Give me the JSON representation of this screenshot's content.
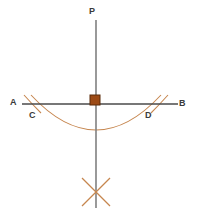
{
  "figure": {
    "kind": "geometry-construction-diagram",
    "background_color": "#ffffff",
    "labels": {
      "perpendicular_top": "P",
      "line_left_end": "A",
      "line_right_end": "B",
      "arc_left_intersection": "C",
      "arc_right_intersection": "D"
    },
    "colors": {
      "line_gray": "#808080",
      "line_dark": "#4a4a4a",
      "arc_tan": "#c6864f",
      "square_fill": "#9c4a15",
      "square_border": "#5a2a08",
      "label_text": "#3a3a3a"
    },
    "geometry": {
      "vertical_line": {
        "x": 96,
        "y_top": 20,
        "y_bottom": 208
      },
      "horizontal_line": {
        "y": 104,
        "x_left": 22,
        "x_right": 178
      },
      "right_angle_marker": {
        "x": 90,
        "y": 95,
        "size": 10
      },
      "main_arc": {
        "start_x": 31,
        "start_y": 95,
        "end_x": 161,
        "end_y": 95,
        "lowest_y": 130
      },
      "cross_mark": {
        "center_x": 96,
        "center_y": 192,
        "radius": 14
      },
      "tick_left": {
        "x": 32,
        "y": 104
      },
      "tick_right": {
        "x": 160,
        "y": 104
      }
    }
  }
}
